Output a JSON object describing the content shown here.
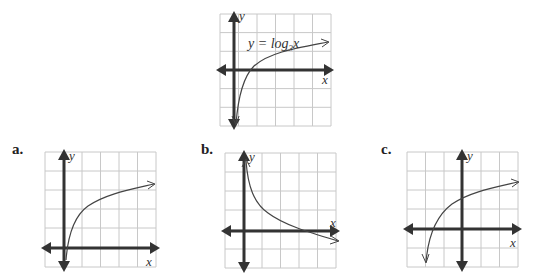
{
  "reference_graph": {
    "equation_label": "y = log",
    "equation_base": "3",
    "equation_var": "x",
    "x_axis_label": "x",
    "y_axis_label": "y",
    "grid": {
      "cols": 6,
      "rows": 6,
      "origin_col": 1,
      "origin_row": 3
    },
    "curve": "y = log3(x), passes through (1,0), (3,1)"
  },
  "options": [
    {
      "label": "a.",
      "x_axis_label": "x",
      "y_axis_label": "y",
      "grid": {
        "cols": 6,
        "rows": 6,
        "origin_col": 1,
        "origin_row": 5
      },
      "curve": "increasing log curve from origin, asymptote x=0, rising to ~y=3.5"
    },
    {
      "label": "b.",
      "x_axis_label": "x",
      "y_axis_label": "y",
      "grid": {
        "cols": 6,
        "rows": 6,
        "origin_col": 1,
        "origin_row": 4
      },
      "curve": "decreasing curve, asymptote x=0 going up, crosses x-axis at x=3"
    },
    {
      "label": "c.",
      "x_axis_label": "x",
      "y_axis_label": "y",
      "grid": {
        "cols": 6,
        "rows": 6,
        "origin_col": 3,
        "origin_row": 4
      },
      "curve": "increasing log curve shifted left, asymptote x=-2, passes (0,~1.6)"
    }
  ],
  "colors": {
    "grid": "#c8c8c8",
    "axis": "#333333",
    "curve": "#444444"
  }
}
